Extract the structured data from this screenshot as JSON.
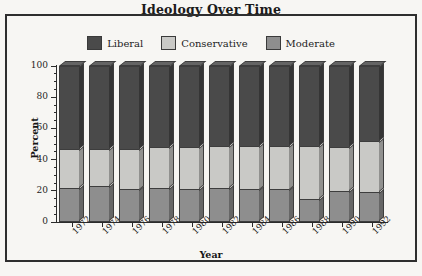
{
  "chart_data": {
    "type": "bar",
    "subtype": "stacked-3d-column",
    "title": "Ideology Over Time",
    "xlabel": "Year",
    "ylabel": "Percent",
    "ylim": [
      0,
      100
    ],
    "yticks": [
      0,
      20,
      40,
      60,
      80,
      100
    ],
    "ytick_labels": [
      "0",
      "20",
      "40",
      "60",
      "80",
      "100"
    ],
    "yminor_step": 5,
    "grid": false,
    "legend_position": "top-center",
    "stack_order_bottom_to_top": [
      "Moderate",
      "Conservative",
      "Liberal"
    ],
    "categories": [
      "1972",
      "1974",
      "1976",
      "1978",
      "1980",
      "1982",
      "1984",
      "1986",
      "1988",
      "1990",
      "1992"
    ],
    "series": [
      {
        "name": "Moderate",
        "color": "#8e8e8e",
        "values": [
          22,
          23,
          21,
          22,
          21,
          22,
          21,
          21,
          15,
          20,
          19
        ]
      },
      {
        "name": "Conservative",
        "color": "#c9c9c6",
        "values": [
          25,
          24,
          26,
          26,
          27,
          27,
          28,
          28,
          34,
          28,
          33
        ]
      },
      {
        "name": "Liberal",
        "color": "#4a4a4a",
        "values": [
          53,
          53,
          53,
          52,
          52,
          51,
          51,
          51,
          51,
          52,
          48
        ]
      }
    ],
    "cumulative_tops": {
      "Moderate": [
        22,
        23,
        21,
        22,
        21,
        22,
        21,
        21,
        15,
        20,
        19
      ],
      "Conservative": [
        47,
        47,
        47,
        48,
        48,
        49,
        49,
        49,
        49,
        48,
        52
      ],
      "Liberal": [
        100,
        100,
        100,
        100,
        100,
        100,
        100,
        100,
        100,
        100,
        100
      ]
    }
  },
  "legend": {
    "items": [
      {
        "label": "Liberal",
        "color": "#4a4a4a"
      },
      {
        "label": "Conservative",
        "color": "#c9c9c6"
      },
      {
        "label": "Moderate",
        "color": "#8e8e8e"
      }
    ]
  },
  "colors": {
    "background": "#f7f6f3",
    "frame": "#2e2e2e",
    "axis": "#2b2b2b",
    "text": "#1b1b1b",
    "bar_outline": "#3d3d3d"
  }
}
